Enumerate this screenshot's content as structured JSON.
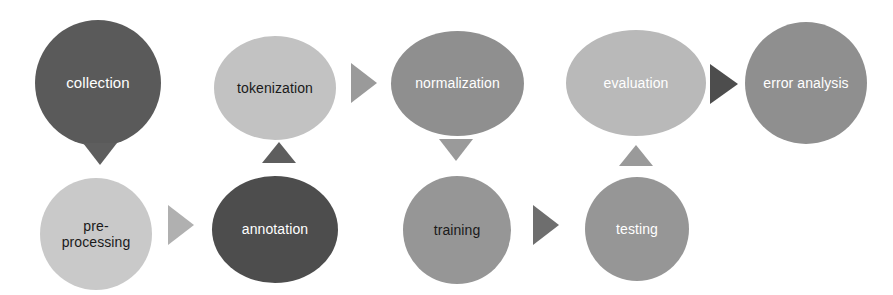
{
  "diagram": {
    "canvas": {
      "width": 893,
      "height": 295,
      "background": "#ffffff"
    },
    "palette": {
      "dark_gray": "#5a5a5a",
      "darkest_gray": "#4d4d4d",
      "mid_gray": "#8f8f8f",
      "medium_gray": "#969696",
      "light_gray": "#b9b9b9",
      "lighter_gray": "#c2c2c2",
      "pale_gray": "#c9c9c9",
      "text_light": "#ffffff",
      "text_dark": "#1a1a1a",
      "arrow_dark": "#5e5e5e",
      "arrow_mid": "#8c8c8c",
      "arrow_light": "#b0b0b0"
    },
    "nodes": [
      {
        "id": "collection",
        "label": "collection",
        "shape": "circle",
        "row": "top",
        "column": 1,
        "x": 35,
        "y": 20,
        "w": 126,
        "h": 126,
        "fill": "#5a5a5a",
        "text_color": "#ffffff",
        "font_size": 15
      },
      {
        "id": "pre-processing",
        "label": "pre-\nprocessing",
        "shape": "circle",
        "row": "bottom",
        "column": 1,
        "x": 40,
        "y": 178,
        "w": 112,
        "h": 112,
        "fill": "#c9c9c9",
        "text_color": "#1a1a1a",
        "font_size": 14
      },
      {
        "id": "tokenization",
        "label": "tokenization",
        "shape": "ellipse",
        "row": "top",
        "column": 2,
        "x": 214,
        "y": 36,
        "w": 122,
        "h": 104,
        "fill": "#c2c2c2",
        "text_color": "#1a1a1a",
        "font_size": 14
      },
      {
        "id": "annotation",
        "label": "annotation",
        "shape": "ellipse",
        "row": "bottom",
        "column": 2,
        "x": 212,
        "y": 176,
        "w": 126,
        "h": 107,
        "fill": "#4d4d4d",
        "text_color": "#ffffff",
        "font_size": 14
      },
      {
        "id": "normalization",
        "label": "normalization",
        "shape": "ellipse",
        "row": "top",
        "column": 3,
        "x": 391,
        "y": 31,
        "w": 133,
        "h": 105,
        "fill": "#8f8f8f",
        "text_color": "#ffffff",
        "font_size": 14
      },
      {
        "id": "training",
        "label": "training",
        "shape": "circle",
        "row": "bottom",
        "column": 3,
        "x": 403,
        "y": 176,
        "w": 108,
        "h": 108,
        "fill": "#969696",
        "text_color": "#1a1a1a",
        "font_size": 14
      },
      {
        "id": "evaluation",
        "label": "evaluation",
        "shape": "ellipse",
        "row": "top",
        "column": 4,
        "x": 566,
        "y": 30,
        "w": 140,
        "h": 106,
        "fill": "#b9b9b9",
        "text_color": "#ffffff",
        "font_size": 14
      },
      {
        "id": "testing",
        "label": "testing",
        "shape": "circle",
        "row": "bottom",
        "column": 4,
        "x": 585,
        "y": 177,
        "w": 104,
        "h": 104,
        "fill": "#969696",
        "text_color": "#ffffff",
        "font_size": 14
      },
      {
        "id": "error-analysis",
        "label": "error analysis",
        "shape": "circle",
        "row": "top",
        "column": 5,
        "x": 745,
        "y": 22,
        "w": 122,
        "h": 122,
        "fill": "#8f8f8f",
        "text_color": "#ffffff",
        "font_size": 14
      }
    ],
    "arrows": [
      {
        "id": "collection-to-pre-processing",
        "from": "collection",
        "to": "pre-processing",
        "direction": "down",
        "x": 83,
        "y": 143,
        "size": 22,
        "color": "#5e5e5e"
      },
      {
        "id": "pre-processing-to-annotation",
        "from": "pre-processing",
        "to": "annotation",
        "direction": "right",
        "x": 168,
        "y": 205,
        "size": 26,
        "color": "#b0b0b0"
      },
      {
        "id": "annotation-to-tokenization",
        "from": "annotation",
        "to": "tokenization",
        "direction": "up",
        "x": 262,
        "y": 142,
        "size": 21,
        "color": "#5e5e5e"
      },
      {
        "id": "tokenization-to-normalization",
        "from": "tokenization",
        "to": "normalization",
        "direction": "right",
        "x": 351,
        "y": 63,
        "size": 26,
        "color": "#9a9a9a"
      },
      {
        "id": "normalization-to-training",
        "from": "normalization",
        "to": "training",
        "direction": "down",
        "x": 439,
        "y": 139,
        "size": 22,
        "color": "#9a9a9a"
      },
      {
        "id": "training-to-testing",
        "from": "training",
        "to": "testing",
        "direction": "right",
        "x": 533,
        "y": 205,
        "size": 26,
        "color": "#6e6e6e"
      },
      {
        "id": "testing-to-evaluation",
        "from": "testing",
        "to": "evaluation",
        "direction": "up",
        "x": 619,
        "y": 145,
        "size": 21,
        "color": "#9a9a9a"
      },
      {
        "id": "evaluation-to-error-analysis",
        "from": "evaluation",
        "to": "error-analysis",
        "direction": "right",
        "x": 710,
        "y": 64,
        "size": 28,
        "color": "#4d4d4d"
      }
    ]
  }
}
